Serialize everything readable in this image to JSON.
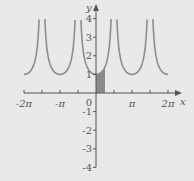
{
  "chart_data": {
    "type": "line",
    "title": "",
    "function": "y = |sec x|",
    "xlabel": "x",
    "ylabel": "y",
    "xlim": [
      -6.2832,
      6.2832
    ],
    "ylim": [
      -4,
      4
    ],
    "grid": false,
    "x_tick_labels": [
      {
        "value": -6.2832,
        "label": "-2π"
      },
      {
        "value": -3.1416,
        "label": "-π"
      },
      {
        "value": 3.1416,
        "label": "π"
      },
      {
        "value": 6.2832,
        "label": "2π"
      }
    ],
    "x_minor_ticks_step": 1.5708,
    "origin_label": "0",
    "y_tick_labels": [
      {
        "value": 4,
        "label": "4"
      },
      {
        "value": 3,
        "label": "3"
      },
      {
        "value": 2,
        "label": "2"
      },
      {
        "value": 1,
        "label": "1"
      },
      {
        "value": -1,
        "label": "-1"
      },
      {
        "value": -2,
        "label": "-2"
      },
      {
        "value": -3,
        "label": "-3"
      },
      {
        "value": -4,
        "label": "-4"
      }
    ],
    "series": [
      {
        "name": "|sec x|",
        "color": "#8c8c8c",
        "x_range": [
          -6.2832,
          6.2832
        ],
        "clip_y": 4,
        "sample_points": [
          [
            -6.2832,
            1
          ],
          [
            -5.4978,
            1.414
          ],
          [
            -5.0,
            3.525
          ],
          [
            -4.1888,
            2
          ],
          [
            -3.1416,
            1
          ],
          [
            -2.0944,
            2
          ],
          [
            -1.3,
            3.738
          ],
          [
            -1.0472,
            2
          ],
          [
            0,
            1
          ],
          [
            0.7854,
            1.414
          ],
          [
            1.0472,
            2
          ],
          [
            1.3,
            3.738
          ],
          [
            3.1416,
            1
          ],
          [
            5.0,
            3.525
          ],
          [
            6.2832,
            1
          ]
        ]
      }
    ],
    "shaded_region": {
      "x_from": 0,
      "x_to": 0.7854,
      "under": "|sec x|",
      "color": "#7a7a7a"
    },
    "annotations": []
  }
}
